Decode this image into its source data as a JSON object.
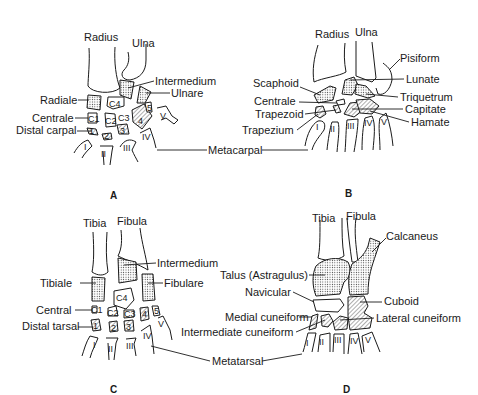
{
  "figure": {
    "panels": [
      {
        "id": "A",
        "title_label": "A",
        "description": "Generalized forelimb (carpus)",
        "labels": {
          "radius": "Radius",
          "ulna": "Ulna",
          "intermedium": "Intermedium",
          "ulnare": "Ulnare",
          "radiale": "Radiale",
          "centrale": "Centrale",
          "distal_carpal": "Distal carpal",
          "metacarpal": "Metacarpal"
        },
        "bone_marks": {
          "c1": "C1",
          "c2": "C2",
          "c3": "C3",
          "c4": "C4",
          "d1": "1",
          "d2": "2",
          "d3": "3",
          "d4": "4",
          "d5": "5",
          "m1": "I",
          "m2": "II",
          "m3": "III",
          "m4": "IV",
          "m5": "V"
        }
      },
      {
        "id": "B",
        "title_label": "B",
        "description": "Human wrist (carpus)",
        "labels": {
          "radius": "Radius",
          "ulna": "Ulna",
          "pisiform": "Pisiform",
          "scaphoid": "Scaphoid",
          "lunate": "Lunate",
          "triquetrum": "Triquetrum",
          "centrale": "Centrale",
          "capitate": "Capitate",
          "trapezoid": "Trapezoid",
          "hamate": "Hamate",
          "trapezium": "Trapezium"
        },
        "bone_marks": {
          "m1": "I",
          "m2": "II",
          "m3": "III",
          "m4": "IV",
          "m5": "V"
        }
      },
      {
        "id": "C",
        "title_label": "C",
        "description": "Generalized hindlimb (tarsus)",
        "labels": {
          "tibia": "Tibia",
          "fibula": "Fibula",
          "intermedium": "Intermedium",
          "tibiale": "Tibiale",
          "fibulare": "Fibulare",
          "central": "Central",
          "distal_tarsal": "Distal tarsal",
          "metatarsal": "Metatarsal"
        },
        "bone_marks": {
          "c1": "C1",
          "c2": "C2",
          "c3": "C3",
          "c4": "C4",
          "d1": "1",
          "d2": "2",
          "d3": "3",
          "d4": "4",
          "d5": "5",
          "m1": "I",
          "m2": "II",
          "m3": "III",
          "m4": "IV",
          "m5": "V"
        }
      },
      {
        "id": "D",
        "title_label": "D",
        "description": "Human ankle (tarsus)",
        "labels": {
          "tibia": "Tibia",
          "fibula": "Fibula",
          "calcaneus": "Calcaneus",
          "talus": "Talus (Astragulus)",
          "navicular": "Navicular",
          "cuboid": "Cuboid",
          "medial_cuneiform": "Medial cuneiform",
          "lateral_cuneiform": "Lateral cuneiform",
          "intermediate_cuneiform": "Intermediate cuneiform"
        },
        "bone_marks": {
          "m1": "I",
          "m2": "II",
          "m3": "III",
          "m4": "IV",
          "m5": "V"
        }
      }
    ],
    "colors": {
      "ink": "#1a1a1a",
      "background": "#ffffff"
    }
  }
}
